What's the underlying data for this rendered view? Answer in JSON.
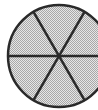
{
  "icon": {
    "name": "six-segment-wheel-icon",
    "center": [
      59,
      56
    ],
    "radius": 51,
    "fill_color": "#c8c8c8",
    "stroke_color": "#2a2a2a",
    "spokes": 3,
    "segments": 6
  }
}
